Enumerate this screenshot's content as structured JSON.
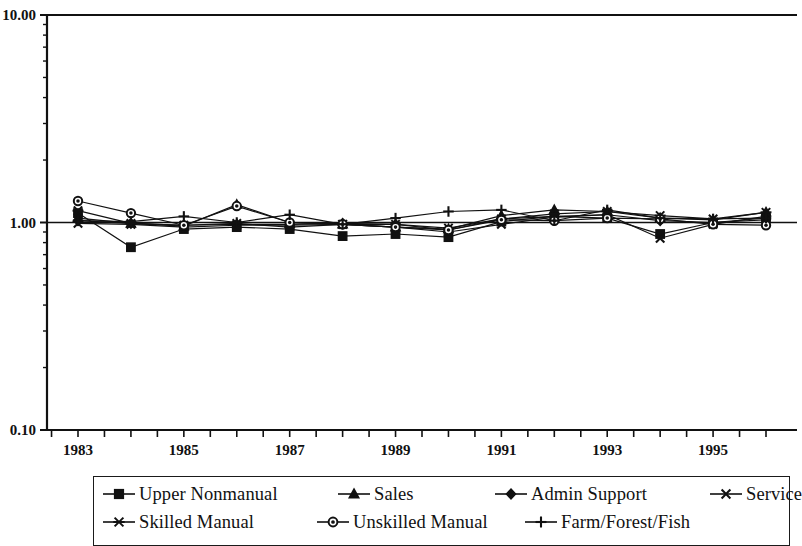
{
  "chart_data": {
    "type": "line",
    "title": "",
    "xlabel": "",
    "ylabel": "",
    "scale": "log",
    "ylim": [
      0.1,
      10.0
    ],
    "ytick_labels": [
      "10.00",
      "1.00",
      "0.10"
    ],
    "ytick_values": [
      10.0,
      1.0,
      0.1
    ],
    "grid": false,
    "reference_line": 1.0,
    "legend_position": "bottom",
    "x": [
      1983,
      1984,
      1985,
      1986,
      1987,
      1988,
      1989,
      1990,
      1991,
      1992,
      1993,
      1994,
      1995,
      1996
    ],
    "xtick_labels": [
      "1983",
      "1985",
      "1987",
      "1989",
      "1991",
      "1993",
      "1995"
    ],
    "xtick_values": [
      1983,
      1985,
      1987,
      1989,
      1991,
      1993,
      1995
    ],
    "series": [
      {
        "name": "Upper Nonmanual",
        "marker": "square",
        "values": [
          1.11,
          0.76,
          0.93,
          0.95,
          0.93,
          0.86,
          0.88,
          0.85,
          1.01,
          1.07,
          1.05,
          0.88,
          1.0,
          1.05
        ]
      },
      {
        "name": "Sales",
        "marker": "triangle",
        "values": [
          1.05,
          0.99,
          0.96,
          1.22,
          1.0,
          0.98,
          0.95,
          0.93,
          1.08,
          1.15,
          1.13,
          1.05,
          1.03,
          1.12
        ]
      },
      {
        "name": "Admin Support",
        "marker": "diamond",
        "values": [
          1.02,
          0.99,
          0.97,
          0.98,
          0.98,
          0.99,
          0.98,
          0.92,
          1.04,
          1.07,
          1.09,
          1.02,
          1.0,
          1.03
        ]
      },
      {
        "name": "Service",
        "marker": "x",
        "values": [
          0.99,
          0.98,
          0.95,
          0.97,
          0.97,
          0.98,
          0.95,
          0.9,
          0.98,
          1.06,
          1.09,
          0.84,
          0.98,
          1.07
        ]
      },
      {
        "name": "Skilled Manual",
        "marker": "star",
        "values": [
          1.14,
          0.99,
          0.97,
          0.99,
          0.95,
          0.98,
          0.98,
          0.94,
          1.04,
          1.1,
          1.13,
          1.08,
          1.04,
          1.12
        ]
      },
      {
        "name": "Unskilled Manual",
        "marker": "circle",
        "values": [
          1.27,
          1.11,
          0.97,
          1.2,
          1.0,
          0.98,
          0.95,
          0.92,
          1.03,
          1.02,
          1.05,
          1.04,
          0.98,
          0.97
        ]
      },
      {
        "name": "Farm/Forest/Fish",
        "marker": "plus",
        "values": [
          1.02,
          1.01,
          1.07,
          1.0,
          1.09,
          0.98,
          1.05,
          1.13,
          1.15,
          1.02,
          1.15,
          1.05,
          1.04,
          1.05
        ]
      }
    ]
  },
  "legend": {
    "items": [
      {
        "label": "Upper Nonmanual",
        "marker": "square"
      },
      {
        "label": "Sales",
        "marker": "triangle"
      },
      {
        "label": "Admin Support",
        "marker": "diamond"
      },
      {
        "label": "Service",
        "marker": "x"
      },
      {
        "label": "Skilled Manual",
        "marker": "star"
      },
      {
        "label": "Unskilled Manual",
        "marker": "circle"
      },
      {
        "label": "Farm/Forest/Fish",
        "marker": "plus"
      }
    ]
  },
  "colors": {
    "ink": "#111111",
    "background": "#ffffff"
  }
}
